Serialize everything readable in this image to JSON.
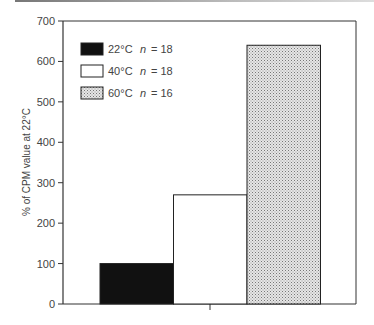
{
  "chart_data": {
    "type": "bar",
    "title": "",
    "xlabel": "",
    "ylabel": "% of CPM value at 22°C",
    "ylim": [
      0,
      700
    ],
    "yticks": [
      0,
      100,
      200,
      300,
      400,
      500,
      600,
      700
    ],
    "grid": false,
    "legend_position": "upper-left",
    "categories": [
      "22°C",
      "40°C",
      "60°C"
    ],
    "series": [
      {
        "name": "22°C",
        "n": 18,
        "value": 100,
        "fill": "#111111",
        "pattern": "solid"
      },
      {
        "name": "40°C",
        "n": 18,
        "value": 270,
        "fill": "#ffffff",
        "pattern": "none"
      },
      {
        "name": "60°C",
        "n": 16,
        "value": 640,
        "fill": "#cfcfcf",
        "pattern": "stipple"
      }
    ],
    "values": [
      100,
      270,
      640
    ]
  },
  "legend": [
    {
      "label": "22°C",
      "n_label": "n",
      "n_eq": "= 18"
    },
    {
      "label": "40°C",
      "n_label": "n",
      "n_eq": "= 18"
    },
    {
      "label": "60°C",
      "n_label": "n",
      "n_eq": "= 16"
    }
  ],
  "axis": {
    "ylabel": "% of CPM value at 22°C",
    "ticks": [
      "0",
      "100",
      "200",
      "300",
      "400",
      "500",
      "600",
      "700"
    ]
  }
}
